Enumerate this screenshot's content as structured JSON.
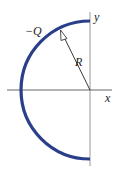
{
  "diagram": {
    "charge_label": "−Q",
    "radius_label": "R",
    "x_axis_label": "x",
    "y_axis_label": "y",
    "arc_color": "#2a3f8a",
    "axis_color": "#888888"
  }
}
